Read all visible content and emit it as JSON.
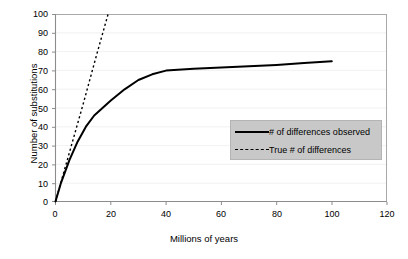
{
  "chart_data": {
    "type": "line",
    "title": "",
    "xlabel": "Millions of years",
    "ylabel": "Number of substitutions",
    "xlim": [
      0,
      120
    ],
    "ylim": [
      0,
      100
    ],
    "xticks": [
      0,
      20,
      40,
      60,
      80,
      100,
      120
    ],
    "yticks": [
      0,
      10,
      20,
      30,
      40,
      50,
      60,
      70,
      80,
      90,
      100
    ],
    "grid": "faint-horizontal",
    "legend_position": "inside-right",
    "series": [
      {
        "name": "# of differences observed",
        "style": "solid",
        "color": "#000000",
        "x": [
          0,
          2,
          5,
          8,
          11,
          14,
          17,
          20,
          25,
          30,
          35,
          40,
          50,
          60,
          70,
          80,
          90,
          100
        ],
        "values": [
          0,
          10,
          22,
          32,
          40,
          46,
          50,
          54,
          60,
          65,
          68,
          70,
          71,
          71.6,
          72.3,
          73,
          74,
          75
        ]
      },
      {
        "name": "True # of differences",
        "style": "dotted",
        "color": "#000000",
        "x": [
          0,
          5,
          10,
          15,
          19
        ],
        "values": [
          0,
          26,
          52,
          79,
          100
        ]
      }
    ]
  },
  "axes": {
    "x_title": "Millions of years",
    "y_title": "Number of substitutions",
    "x_tick_labels": [
      "0",
      "20",
      "40",
      "60",
      "80",
      "100",
      "120"
    ],
    "y_tick_labels": [
      "0",
      "10",
      "20",
      "30",
      "40",
      "50",
      "60",
      "70",
      "80",
      "90",
      "100"
    ]
  },
  "legend": {
    "background_color": "#c8c8c8",
    "items": [
      {
        "label": "# of differences observed",
        "style": "solid"
      },
      {
        "label": "True # of differences",
        "style": "dotted"
      }
    ]
  },
  "colors": {
    "plot_background": "#ffffff",
    "axis_line": "#a0a0a0",
    "series_line": "#000000",
    "legend_background": "#c8c8c8"
  }
}
